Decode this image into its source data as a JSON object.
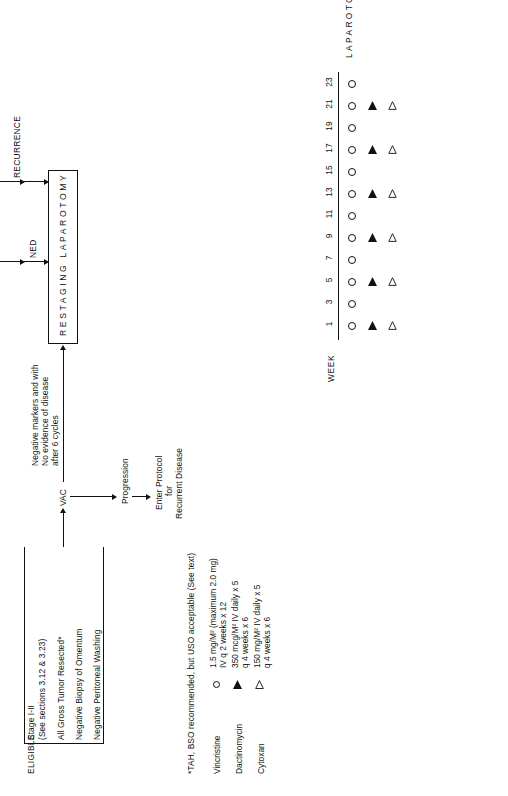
{
  "diagram": {
    "orientation": "rotated-90-ccw"
  },
  "eligibility": {
    "heading": "ELIGIBLE",
    "criteria": [
      "Stage I-II",
      "(See sections 3.12 & 3.23)",
      "All Gross Tumor Resected*",
      "Negative Biopsy of Omentum",
      "Negative Peritoneal Washing"
    ]
  },
  "flow": {
    "vac_label": "VAC",
    "progression_label": "Progression",
    "enter_protocol_label": "Enter Protocol",
    "for_label": "for",
    "recurrent_disease_label": "Recurrent Disease",
    "negative_markers_line1": "Negative markers and with",
    "negative_markers_line2": "No evidence of disease",
    "negative_markers_line3": "after 6 cycles",
    "restaging_box_label": "RESTAGING LAPAROTOMY",
    "ned_label": "NED",
    "recurrence_label": "RECURRENCE",
    "three_cycle_line1": "3 cycle",
    "three_cycle_line2": "VAC",
    "no_progression_line1": "No",
    "no_progression_line2": "Progression",
    "no_progression_line3": "STOP VAC",
    "progression_right_label": "Progression",
    "enter_protocol_recurrent_line1": "Enter",
    "enter_protocol_recurrent_line2": "Protocol for",
    "enter_protocol_recurrent_line3": "Recurrent",
    "enter_protocol_recurrent_line4": "Diseases",
    "recurrence_enter_line1": "Enter",
    "recurrence_enter_line2": "Protocol",
    "recurrence_enter_line3": "for",
    "recurrence_enter_line4": "Recurrent",
    "recurrence_enter_line5": "Disease"
  },
  "footnote": "*TAH, BSO recommended, but USO acceptable (See text)",
  "schedule": {
    "week_axis_label": "WEEK",
    "weeks": [
      1,
      3,
      5,
      7,
      9,
      11,
      13,
      15,
      17,
      19,
      21,
      23
    ],
    "row_label": "LAPAROTOMY",
    "rows": [
      {
        "symbol": "circle",
        "drug": "Vincristine",
        "weeks": [
          1,
          3,
          5,
          7,
          9,
          11,
          13,
          15,
          17,
          19,
          21,
          23
        ]
      },
      {
        "symbol": "tri-f",
        "drug": "Dactinomycin",
        "weeks": [
          1,
          5,
          9,
          13,
          17,
          21
        ]
      },
      {
        "symbol": "tri-o",
        "drug": "Cytoxan",
        "weeks": [
          1,
          5,
          9,
          13,
          17,
          21
        ]
      }
    ]
  },
  "legend": {
    "items": [
      {
        "symbol": "circle",
        "name": "Vincristine",
        "dose_line1": "1.5 mg/M² (maximum 2.0 mg)",
        "dose_line2": "IV q 2 weeks x 12"
      },
      {
        "symbol": "tri-f",
        "name": "Dactinomycin",
        "dose_line1": "350 mcg/M² IV daily x 5",
        "dose_line2": "q 4 weeks x 6"
      },
      {
        "symbol": "tri-o",
        "name": "Cytoxan",
        "dose_line1": "150 mg/M² IV daily x 5",
        "dose_line2": "q 4 weeks x 6"
      }
    ]
  },
  "colors": {
    "ink": "#111111",
    "paper": "#ffffff"
  }
}
